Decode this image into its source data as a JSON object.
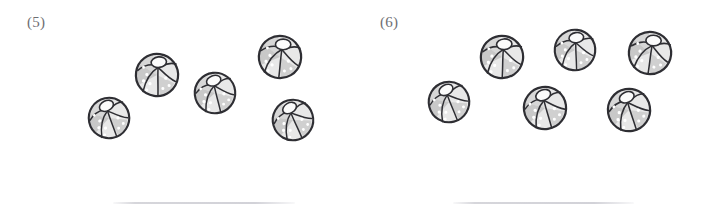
{
  "page": {
    "background_color": "#ffffff",
    "width": 710,
    "height": 213,
    "kind": "counting-worksheet"
  },
  "style": {
    "outline_color": "#2e2e33",
    "panel_light_color": "#e8e8e8",
    "panel_dark_color": "#c8c8c8",
    "cap_color": "#fbfbfb",
    "dot_color": "#ffffff",
    "label_color": "#6e6e72",
    "answer_line_color": "#d6d6db"
  },
  "groups": [
    {
      "id": "group-5",
      "label": "(5)",
      "label_x": 27,
      "label_y": 15,
      "ball_count": 5,
      "answer_line": {
        "x": 113,
        "y": 202,
        "width": 182
      },
      "balls": [
        {
          "cx": 109,
          "cy": 118,
          "r": 23,
          "rotation": -12
        },
        {
          "cx": 157,
          "cy": 75,
          "r": 24,
          "rotation": 8
        },
        {
          "cx": 215,
          "cy": 93,
          "r": 23,
          "rotation": -6
        },
        {
          "cx": 280,
          "cy": 57,
          "r": 24,
          "rotation": 14
        },
        {
          "cx": 293,
          "cy": 120,
          "r": 23,
          "rotation": -16
        }
      ]
    },
    {
      "id": "group-6",
      "label": "(6)",
      "label_x": 380,
      "label_y": 15,
      "ball_count": 6,
      "answer_line": {
        "x": 453,
        "y": 202,
        "width": 181
      },
      "balls": [
        {
          "cx": 449,
          "cy": 102,
          "r": 23,
          "rotation": -14
        },
        {
          "cx": 502,
          "cy": 57,
          "r": 24,
          "rotation": 10
        },
        {
          "cx": 545,
          "cy": 108,
          "r": 24,
          "rotation": -8
        },
        {
          "cx": 575,
          "cy": 50,
          "r": 23,
          "rotation": 6
        },
        {
          "cx": 650,
          "cy": 53,
          "r": 24,
          "rotation": 16
        },
        {
          "cx": 629,
          "cy": 110,
          "r": 24,
          "rotation": -10
        }
      ]
    }
  ],
  "icons": {
    "ball": "beach-ball-icon"
  }
}
